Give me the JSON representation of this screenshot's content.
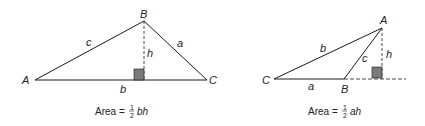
{
  "figures": [
    {
      "id": "acute-case",
      "vertices": {
        "left": "A",
        "top": "B",
        "right": "C"
      },
      "sides": {
        "left_side": "c",
        "right_side": "a",
        "base": "b"
      },
      "altitude": "h",
      "formula": {
        "prefix": "Area =",
        "num": "1",
        "den": "2",
        "vars": "bh"
      }
    },
    {
      "id": "obtuse-case",
      "vertices": {
        "left": "C",
        "base_right": "B",
        "top": "A"
      },
      "sides": {
        "long_side": "b",
        "short_side": "c",
        "base": "a"
      },
      "altitude": "h",
      "formula": {
        "prefix": "Area =",
        "num": "1",
        "den": "2",
        "vars": "ah"
      }
    }
  ],
  "colors": {
    "line": "#1a1a1a",
    "square": "#7a7a7a"
  }
}
